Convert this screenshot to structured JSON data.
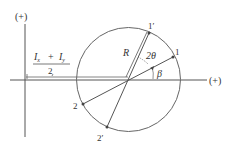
{
  "diagram": {
    "axes": {
      "vertical_label": "(+)",
      "horizontal_label": "(+)"
    },
    "center_offset": {
      "numerator_a": "I",
      "numerator_a_sub": "x",
      "plus": "+",
      "numerator_b": "I",
      "numerator_b_sub": "y",
      "denominator": "2"
    },
    "radius_label": "R",
    "angle_2theta_label": "2θ",
    "angle_beta_label": "β",
    "points": [
      {
        "id": "1",
        "label": "1"
      },
      {
        "id": "1p",
        "label": "1′"
      },
      {
        "id": "2",
        "label": "2"
      },
      {
        "id": "2p",
        "label": "2′"
      }
    ],
    "colors": {
      "line": "#555555",
      "text": "#333333",
      "background": "#ffffff"
    }
  }
}
